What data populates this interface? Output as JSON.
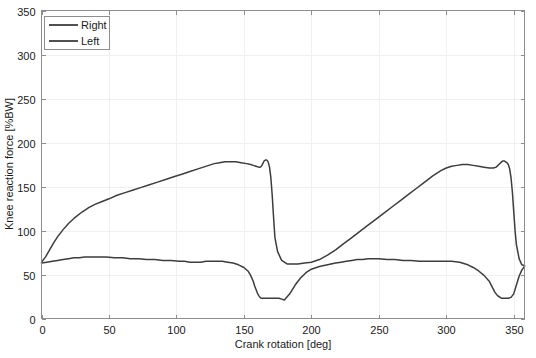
{
  "chart_data": {
    "type": "line",
    "title": "",
    "xlabel": "Crank rotation [deg]",
    "ylabel": "Knee reaction force [%BW]",
    "xlim": [
      0,
      358
    ],
    "ylim": [
      0,
      350
    ],
    "xticks": [
      0,
      50,
      100,
      150,
      200,
      250,
      300,
      350
    ],
    "yticks": [
      0,
      50,
      100,
      150,
      200,
      250,
      300,
      350
    ],
    "xtick_labels": [
      "0",
      "50",
      "100",
      "150",
      "200",
      "250",
      "300",
      "350"
    ],
    "ytick_labels": [
      "0",
      "50",
      "100",
      "150",
      "200",
      "250",
      "300",
      "350"
    ],
    "grid": true,
    "legend_position": "upper left",
    "series": [
      {
        "name": "Right",
        "color": "#3d3d3d",
        "x": [
          0,
          3,
          6,
          9,
          12,
          16,
          20,
          25,
          30,
          35,
          40,
          45,
          50,
          56,
          62,
          68,
          74,
          80,
          86,
          92,
          98,
          104,
          110,
          116,
          120,
          124,
          128,
          132,
          136,
          140,
          144,
          148,
          152,
          155,
          157,
          159,
          161,
          162,
          163,
          164,
          165,
          166,
          167,
          168,
          169,
          170,
          171,
          172,
          173,
          175,
          178,
          182,
          186,
          190,
          195,
          200,
          206,
          212,
          218,
          224,
          230,
          236,
          242,
          248,
          254,
          260,
          266,
          272,
          278,
          284,
          290,
          296,
          300,
          304,
          308,
          312,
          316,
          320,
          324,
          328,
          332,
          335,
          337,
          339,
          341,
          342,
          343,
          344,
          345,
          346,
          347,
          348,
          349,
          350,
          351,
          352,
          354,
          356,
          358
        ],
        "y": [
          64,
          70,
          78,
          86,
          93,
          101,
          108,
          115,
          121,
          126,
          130,
          133,
          136,
          140,
          143,
          146,
          149,
          152,
          155,
          158,
          161,
          164,
          167,
          170,
          172,
          174,
          176,
          177,
          178,
          178,
          178,
          177,
          176,
          175,
          174,
          173,
          172,
          172,
          173,
          176,
          179,
          180,
          180,
          178,
          172,
          160,
          140,
          115,
          92,
          76,
          66,
          62,
          62,
          62,
          63,
          64,
          67,
          72,
          78,
          85,
          92,
          99,
          106,
          113,
          120,
          127,
          134,
          141,
          148,
          155,
          162,
          168,
          171,
          173,
          174,
          175,
          175,
          174,
          173,
          172,
          171,
          171,
          172,
          175,
          178,
          179,
          179,
          178,
          177,
          175,
          170,
          160,
          144,
          122,
          100,
          84,
          68,
          61,
          60
        ]
      },
      {
        "name": "Left",
        "color": "#3d3d3d",
        "x": [
          0,
          4,
          8,
          12,
          16,
          20,
          24,
          28,
          32,
          36,
          40,
          44,
          48,
          54,
          60,
          66,
          72,
          78,
          84,
          90,
          96,
          102,
          106,
          110,
          114,
          118,
          122,
          126,
          130,
          134,
          138,
          142,
          146,
          150,
          153,
          155,
          157,
          158,
          159,
          160,
          161,
          162,
          163,
          164,
          166,
          168,
          170,
          172,
          174,
          176,
          178,
          180,
          184,
          188,
          192,
          196,
          200,
          206,
          212,
          218,
          222,
          226,
          230,
          234,
          238,
          242,
          246,
          250,
          256,
          262,
          268,
          274,
          280,
          286,
          292,
          298,
          304,
          310,
          316,
          320,
          324,
          328,
          332,
          334,
          336,
          338,
          339,
          340,
          341,
          342,
          344,
          346,
          348,
          350,
          352,
          354,
          356,
          358
        ],
        "y": [
          63,
          64,
          65,
          66,
          67,
          68,
          69,
          69,
          70,
          70,
          70,
          70,
          70,
          69,
          69,
          68,
          68,
          67,
          67,
          66,
          66,
          65,
          65,
          64,
          64,
          64,
          65,
          65,
          65,
          65,
          64,
          63,
          61,
          58,
          54,
          49,
          42,
          37,
          33,
          29,
          26,
          24,
          23,
          23,
          23,
          23,
          23,
          23,
          23,
          23,
          22,
          21,
          28,
          38,
          46,
          52,
          56,
          59,
          61,
          63,
          64,
          65,
          66,
          67,
          67,
          68,
          68,
          68,
          67,
          67,
          66,
          66,
          65,
          65,
          65,
          65,
          65,
          64,
          61,
          58,
          54,
          49,
          42,
          36,
          30,
          26,
          25,
          24,
          23,
          23,
          23,
          23,
          24,
          28,
          38,
          48,
          55,
          59
        ]
      }
    ]
  },
  "legend": {
    "items": [
      {
        "label": "Right"
      },
      {
        "label": "Left"
      }
    ]
  },
  "colors": {
    "axis": "#8d8d8d",
    "grid": "#f0f0f0",
    "series_right": "#3d3d3d",
    "series_left": "#3d3d3d",
    "background": "#ffffff",
    "text": "#1a1a1a"
  }
}
